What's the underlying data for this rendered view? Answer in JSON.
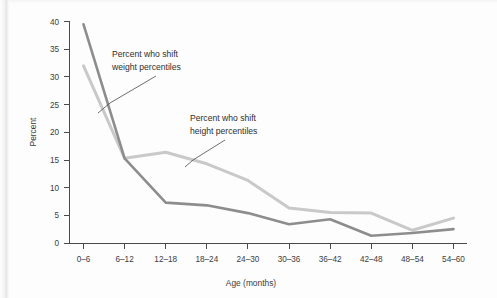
{
  "chart_data": {
    "type": "line",
    "title": "",
    "xlabel": "Age (months)",
    "ylabel": "Percent",
    "categories": [
      "0–6",
      "6–12",
      "12–18",
      "18–24",
      "24–30",
      "30–36",
      "36–42",
      "42–48",
      "48–54",
      "54–60"
    ],
    "ylim": [
      0,
      40
    ],
    "yticks": [
      0,
      5,
      10,
      15,
      20,
      25,
      30,
      35,
      40
    ],
    "ytick_labels": [
      "0",
      "5",
      "10",
      "15",
      "20",
      "25",
      "30",
      "35",
      "40"
    ],
    "grid": false,
    "legend_position": "inline-annotations",
    "series": [
      {
        "name": "Percent who shift weight percentiles",
        "color": "#8d8d8d",
        "values": [
          39.5,
          15.3,
          7.3,
          6.8,
          5.4,
          3.4,
          4.3,
          1.3,
          1.8,
          2.5
        ]
      },
      {
        "name": "Percent who shift height percentiles",
        "color": "#c9c9c9",
        "values": [
          32.0,
          15.3,
          16.4,
          14.3,
          11.3,
          6.3,
          5.5,
          5.4,
          2.3,
          4.5
        ]
      }
    ],
    "annotations": [
      {
        "id": "weight-annotation",
        "line1": "Percent who shift",
        "line2": "weight percentiles",
        "target_category": "0–6"
      },
      {
        "id": "height-annotation",
        "line1": "Percent who shift",
        "line2": "height percentiles",
        "target_category": "18–24"
      }
    ]
  }
}
